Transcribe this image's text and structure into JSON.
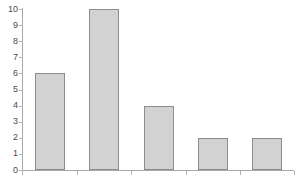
{
  "chart_data": {
    "type": "bar",
    "title": "",
    "subtitle": "",
    "xlabel": "",
    "ylabel": "",
    "categories": [
      "",
      "",
      "",
      "",
      ""
    ],
    "values": [
      6,
      10,
      4,
      2,
      2
    ],
    "ylim": [
      0,
      10
    ],
    "y_ticks": [
      0,
      1,
      2,
      3,
      4,
      5,
      6,
      7,
      8,
      9,
      10
    ],
    "y_tick_labels": [
      "0",
      "1",
      "2",
      "3",
      "4",
      "5",
      "6",
      "7",
      "8",
      "9",
      "10"
    ],
    "x_tick_labels": [],
    "grid": false,
    "legend": null,
    "legend_position": "none",
    "annotations": [],
    "colors": {
      "bar_fill": "#d2d2d2",
      "bar_border": "#8c8c8c",
      "axis": "#a8a8a8",
      "tick": "#b4b4b4",
      "tick_label": "#4a4a4a",
      "background": "#ffffff"
    }
  }
}
